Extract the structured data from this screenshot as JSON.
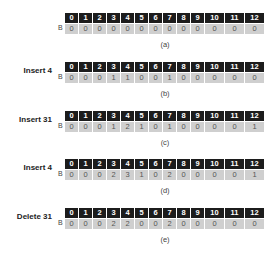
{
  "indices": [
    "0",
    "1",
    "2",
    "3",
    "4",
    "5",
    "6",
    "7",
    "8",
    "9",
    "10",
    "11",
    "12"
  ],
  "row_label": "B",
  "panels": [
    {
      "operation": "",
      "values": [
        "0",
        "0",
        "0",
        "0",
        "0",
        "0",
        "0",
        "0",
        "0",
        "0",
        "0",
        "0",
        "0"
      ],
      "caption": "(a)"
    },
    {
      "operation": "Insert 4",
      "values": [
        "0",
        "0",
        "0",
        "1",
        "1",
        "0",
        "0",
        "1",
        "0",
        "0",
        "0",
        "0",
        "0"
      ],
      "caption": "(b)"
    },
    {
      "operation": "Insert 31",
      "values": [
        "0",
        "0",
        "0",
        "1",
        "2",
        "1",
        "0",
        "1",
        "0",
        "0",
        "0",
        "0",
        "1"
      ],
      "caption": "(c)"
    },
    {
      "operation": "Insert 4",
      "values": [
        "0",
        "0",
        "0",
        "2",
        "3",
        "1",
        "0",
        "2",
        "0",
        "0",
        "0",
        "0",
        "1"
      ],
      "caption": "(d)"
    },
    {
      "operation": "Delete 31",
      "values": [
        "0",
        "0",
        "0",
        "2",
        "2",
        "0",
        "0",
        "2",
        "0",
        "0",
        "0",
        "0",
        "0"
      ],
      "caption": "(e)"
    }
  ]
}
